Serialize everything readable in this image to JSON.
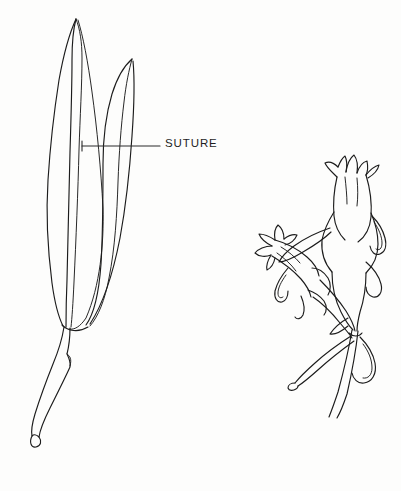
{
  "figure": {
    "kind": "botanical-line-drawing",
    "background_color": "#fdfdfc",
    "ink_color": "#1c1c1c",
    "width": 401,
    "height": 491
  },
  "annotations": [
    {
      "id": "suture",
      "label": "SUTURE",
      "label_x": 165,
      "label_y": 137,
      "leader_from_x": 82,
      "leader_from_y": 146,
      "leader_to_x": 160,
      "leader_to_y": 146
    }
  ],
  "specimens": {
    "left": {
      "name": "seed-pod",
      "description": "elongated pointed seed pod with two visible sutures and a long curved stalk"
    },
    "right": {
      "name": "flowering-stem",
      "description": "stem bearing two tubular flowers with flared pointed lobes, plus narrow bracts and leaves"
    }
  }
}
